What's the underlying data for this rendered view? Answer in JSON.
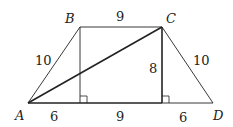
{
  "figure": {
    "type": "trapezoid",
    "points": {
      "A": {
        "label": "A",
        "x": 28,
        "y": 103
      },
      "B": {
        "label": "B",
        "x": 80,
        "y": 27
      },
      "C": {
        "label": "C",
        "x": 162,
        "y": 27
      },
      "D": {
        "label": "D",
        "x": 213,
        "y": 103
      }
    },
    "measures": {
      "AB": "10",
      "BC": "9",
      "CD": "10",
      "height": "8",
      "base_left": "6",
      "base_mid": "9",
      "base_right": "6"
    },
    "colors": {
      "stroke": "#222222",
      "background": "#ffffff"
    }
  }
}
